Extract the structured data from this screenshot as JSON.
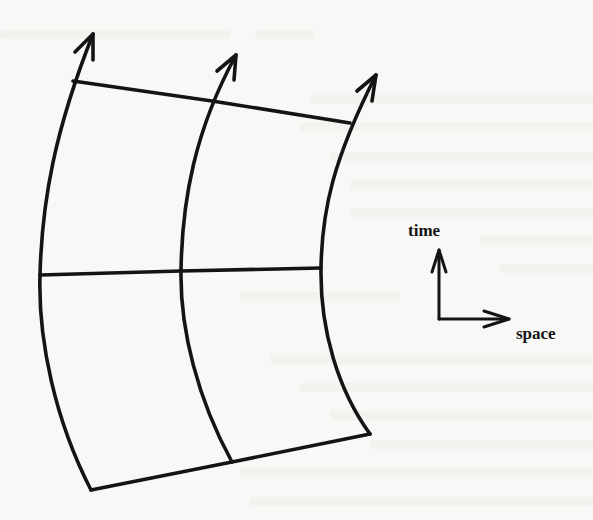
{
  "figure": {
    "axes": {
      "time_label": "time",
      "space_label": "space"
    },
    "worldlines": [
      {
        "name": "left",
        "points": [
          [
            91,
            490
          ],
          [
            40,
            275
          ],
          [
            73,
            81
          ]
        ],
        "arrow_tip": [
          93,
          34
        ]
      },
      {
        "name": "middle",
        "points": [
          [
            232,
            462
          ],
          [
            181,
            271
          ],
          [
            212,
            101
          ]
        ],
        "arrow_tip": [
          236,
          55
        ]
      },
      {
        "name": "right",
        "points": [
          [
            370,
            434
          ],
          [
            321,
            268
          ],
          [
            350,
            123
          ]
        ],
        "arrow_tip": [
          376,
          75
        ]
      }
    ],
    "slices": [
      {
        "name": "top",
        "points": [
          [
            73,
            81
          ],
          [
            212,
            101
          ],
          [
            350,
            123
          ]
        ]
      },
      {
        "name": "middle",
        "points": [
          [
            40,
            275
          ],
          [
            181,
            271
          ],
          [
            321,
            268
          ]
        ]
      },
      {
        "name": "bottom",
        "points": [
          [
            91,
            490
          ],
          [
            232,
            462
          ],
          [
            370,
            434
          ]
        ]
      }
    ],
    "colors": {
      "ink": "#141414",
      "paper": "#f8f8f6"
    }
  }
}
